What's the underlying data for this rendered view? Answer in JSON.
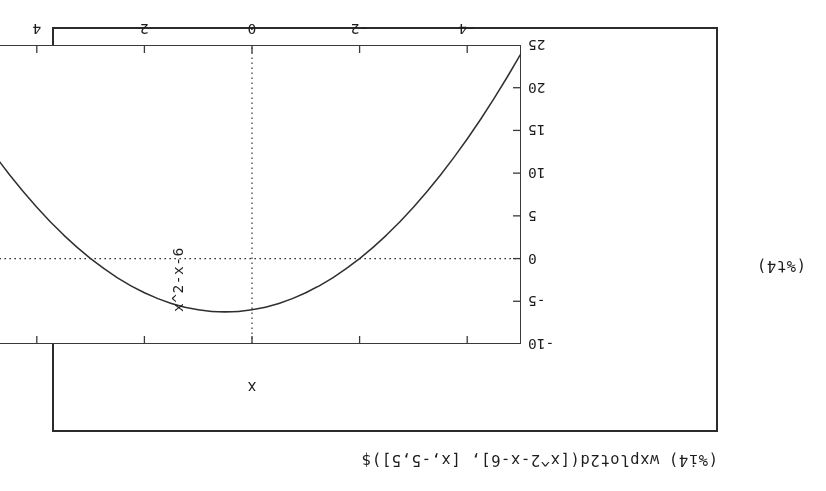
{
  "cell": {
    "input_label": "(%i4)",
    "input_expression": "wxplot2d([x^2-x-6], [x,-5,5])$",
    "output_label": "(%t4)"
  },
  "chart_data": {
    "type": "line",
    "title": "",
    "xlabel": "x",
    "ylabel": "x^2-x-6",
    "expression": "x^2-x-6",
    "xlim": [
      -5,
      5
    ],
    "ylim": [
      -10,
      25
    ],
    "xticks": [
      -4,
      -2,
      0,
      2,
      4
    ],
    "xtick_labels": [
      "-4",
      "-2",
      "0",
      "2",
      "4"
    ],
    "yticks": [
      -10,
      -5,
      0,
      5,
      10,
      15,
      20,
      25
    ],
    "ytick_labels": [
      "-10",
      "-5",
      "0",
      "5",
      "10",
      "15",
      "20",
      "25"
    ],
    "grid": "zero-axes-dotted",
    "legend": "none",
    "line_color": "#2f2f2f",
    "frame_color": "#3a3a3a",
    "background": "#ffffff",
    "orientation": "rotated-180",
    "x": [
      -5.0,
      -4.75,
      -4.5,
      -4.25,
      -4.0,
      -3.75,
      -3.5,
      -3.25,
      -3.0,
      -2.75,
      -2.5,
      -2.25,
      -2.0,
      -1.75,
      -1.5,
      -1.25,
      -1.0,
      -0.75,
      -0.5,
      -0.25,
      0.0,
      0.25,
      0.5,
      0.75,
      1.0,
      1.25,
      1.5,
      1.75,
      2.0,
      2.25,
      2.5,
      2.75,
      3.0,
      3.25,
      3.5,
      3.75,
      4.0,
      4.25,
      4.5,
      4.75,
      5.0
    ],
    "y": [
      24.0,
      21.3125,
      18.75,
      16.3125,
      14.0,
      11.8125,
      9.75,
      7.8125,
      6.0,
      4.3125,
      2.75,
      1.3125,
      0.0,
      -1.1875,
      -2.25,
      -3.1875,
      -4.0,
      -4.6875,
      -5.25,
      -5.6875,
      -6.0,
      -6.1875,
      -6.25,
      -6.1875,
      -6.0,
      -5.6875,
      -5.25,
      -4.6875,
      -4.0,
      -3.1875,
      -2.25,
      -1.1875,
      0.0,
      1.3125,
      2.75,
      4.3125,
      6.0,
      7.8125,
      9.75,
      11.8125,
      14.0
    ],
    "roots": [
      -2,
      3
    ],
    "vertex": [
      0.5,
      -6.25
    ]
  }
}
